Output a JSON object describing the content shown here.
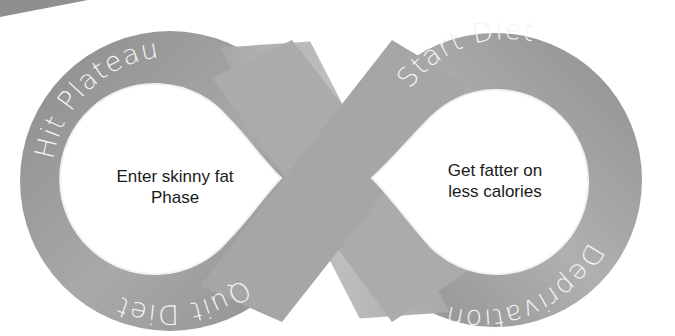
{
  "diagram": {
    "type": "infinity-cycle",
    "stages": {
      "top_left": "Hit Plateau",
      "top_right": "Start Diet",
      "bottom_right": "Deprivation",
      "bottom_left": "Quit Diet"
    },
    "left_loop": {
      "line1": "Enter skinny fat",
      "line2": "Phase"
    },
    "right_loop": {
      "line1": "Get fatter on",
      "line2": "less calories"
    },
    "colors": {
      "band_light": "#b5b5b5",
      "band_dark": "#8a8a8a",
      "label_text": "#f4f4f4",
      "inner_text": "#1a1a1a",
      "background": "#ffffff"
    }
  }
}
